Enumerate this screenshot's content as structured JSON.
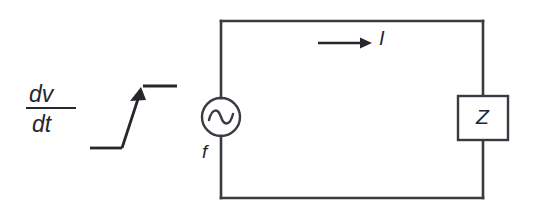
{
  "figure": {
    "type": "circuit-diagram",
    "background_color": "#ffffff",
    "line_color": "#3a3a42",
    "label_color": "#26262c"
  },
  "labels": {
    "current": "I",
    "impedance": "Z",
    "frequency": "f",
    "derivative_numerator": "dv",
    "derivative_denominator": "dt",
    "derivative_full": "dv/dt"
  },
  "components": [
    {
      "name": "ac-voltage-source",
      "symbol": "sine-in-circle",
      "label": "f",
      "center_x": 221,
      "center_y": 117,
      "radius": 19
    },
    {
      "name": "impedance-block",
      "symbol": "rectangle",
      "label": "Z",
      "x": 458,
      "y": 96,
      "width": 50,
      "height": 44
    },
    {
      "name": "current-arrow",
      "symbol": "right-arrow",
      "label": "I",
      "x1": 318,
      "x2": 372,
      "y": 43
    },
    {
      "name": "ramp-waveform",
      "symbol": "step-ramp-with-arrow",
      "label": "dv/dt"
    }
  ],
  "loop": {
    "name": "circuit-loop",
    "left": 221,
    "top": 21,
    "right": 483,
    "bottom": 198
  }
}
